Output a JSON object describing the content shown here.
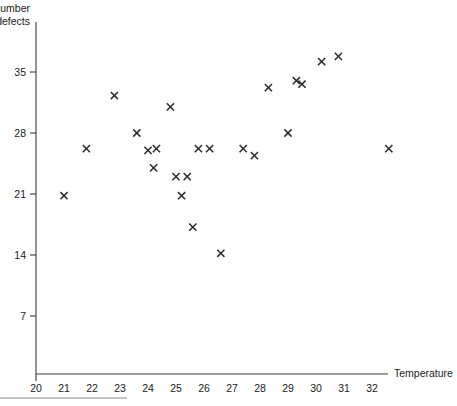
{
  "chart_data": {
    "type": "scatter",
    "title": "",
    "xlabel": "Temperature",
    "ylabel": "Number of defects",
    "ylabel_line1": "Number",
    "ylabel_line2": "of defects",
    "xlim": [
      20,
      33
    ],
    "ylim": [
      0,
      38
    ],
    "xticks": [
      20,
      21,
      22,
      23,
      24,
      25,
      26,
      27,
      28,
      29,
      30,
      31,
      32
    ],
    "yticks": [
      7,
      14,
      21,
      28,
      35
    ],
    "xtick_labels": [
      "20",
      "21",
      "22",
      "23",
      "24",
      "25",
      "26",
      "27",
      "28",
      "29",
      "30",
      "31",
      "32"
    ],
    "ytick_labels": [
      "7",
      "14",
      "21",
      "28",
      "35"
    ],
    "grid": false,
    "legend": false,
    "marker": "x",
    "marker_color": "#2b2b2b",
    "points": [
      {
        "x": 21.0,
        "y": 20.8
      },
      {
        "x": 21.8,
        "y": 26.2
      },
      {
        "x": 22.8,
        "y": 32.3
      },
      {
        "x": 23.6,
        "y": 28.0
      },
      {
        "x": 24.0,
        "y": 26.0
      },
      {
        "x": 24.2,
        "y": 24.0
      },
      {
        "x": 24.3,
        "y": 26.2
      },
      {
        "x": 24.8,
        "y": 31.0
      },
      {
        "x": 25.0,
        "y": 23.0
      },
      {
        "x": 25.2,
        "y": 20.8
      },
      {
        "x": 25.4,
        "y": 23.0
      },
      {
        "x": 25.6,
        "y": 17.2
      },
      {
        "x": 25.8,
        "y": 26.2
      },
      {
        "x": 26.2,
        "y": 26.2
      },
      {
        "x": 26.6,
        "y": 14.2
      },
      {
        "x": 27.4,
        "y": 26.2
      },
      {
        "x": 27.8,
        "y": 25.4
      },
      {
        "x": 28.3,
        "y": 33.2
      },
      {
        "x": 29.0,
        "y": 28.0
      },
      {
        "x": 29.3,
        "y": 34.0
      },
      {
        "x": 29.5,
        "y": 33.6
      },
      {
        "x": 30.2,
        "y": 36.2
      },
      {
        "x": 30.8,
        "y": 36.8
      },
      {
        "x": 32.6,
        "y": 26.2
      }
    ]
  }
}
